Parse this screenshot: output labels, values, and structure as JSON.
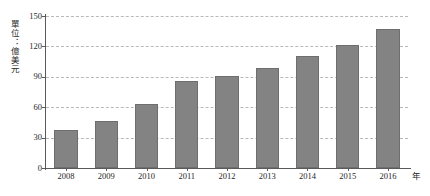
{
  "chart_data": {
    "type": "bar",
    "title": "",
    "subtitle": "",
    "xlabel": "年",
    "ylabel": "單位：億美元",
    "categories": [
      "2008",
      "2009",
      "2010",
      "2011",
      "2012",
      "2013",
      "2014",
      "2015",
      "2016"
    ],
    "values": [
      38,
      46,
      63,
      86,
      91,
      99,
      111,
      121,
      137
    ],
    "series": [
      {
        "name": "",
        "values": [
          38,
          46,
          63,
          86,
          91,
          99,
          111,
          121,
          137
        ]
      }
    ],
    "ylim": [
      0,
      150
    ],
    "yticks": [
      0,
      30,
      60,
      90,
      120,
      150
    ],
    "ytick_labels": [
      "0",
      "30",
      "60",
      "90",
      "120",
      "150"
    ],
    "grid": true,
    "grid_style": "dashed",
    "grid_axis": "y",
    "legend": false,
    "legend_position": "none",
    "bar_color": "#838383",
    "bar_border_color": "#6e6e6e",
    "grid_color": "#b9b9b9",
    "axis_color": "#5a5a5a",
    "text_color": "#1f1f1f",
    "background_color": "#ffffff"
  },
  "axes": {
    "y_unit_caption": "單位：億美元",
    "x_unit_caption": "年"
  }
}
